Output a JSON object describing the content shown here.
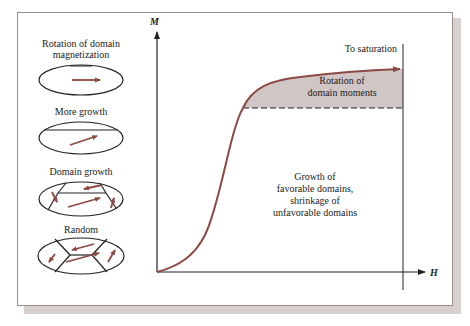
{
  "figure": {
    "type": "magnetization-curve-diagram",
    "axes": {
      "y_label": "M",
      "x_label": "H"
    },
    "curve_color": "#8b4a44",
    "shade_color": "#cfc6c5",
    "regions": {
      "saturation_label": "To saturation",
      "rotation_label_line1": "Rotation of",
      "rotation_label_line2": "domain moments",
      "growth_label_line1": "Growth of",
      "growth_label_line2": "favorable domains,",
      "growth_label_line3": "shrinkage of",
      "growth_label_line4": "unfavorable domains"
    },
    "domain_stages": [
      {
        "label_line1": "Rotation of domain",
        "label_line2": "magnetization"
      },
      {
        "label_line1": "More growth"
      },
      {
        "label_line1": "Domain growth"
      },
      {
        "label_line1": "Random"
      }
    ]
  }
}
